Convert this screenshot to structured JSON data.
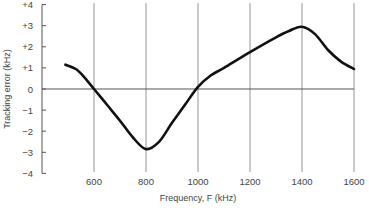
{
  "chart_data": {
    "type": "line",
    "title": "",
    "xlabel": "Frequency, F (kHz)",
    "ylabel": "Tracking error (kHz)",
    "xlim": [
      430,
      1600
    ],
    "ylim": [
      -4,
      4
    ],
    "x_ticks": [
      600,
      800,
      1000,
      1200,
      1400,
      1600
    ],
    "x_tick_labels": [
      "600",
      "800",
      "1000",
      "1200",
      "1400",
      "1600"
    ],
    "y_ticks": [
      4,
      3,
      2,
      1,
      0,
      -1,
      -2,
      -3,
      -4
    ],
    "y_tick_labels": [
      "+4",
      "+3",
      "+2",
      "+1",
      "0",
      "−1",
      "−2",
      "−3",
      "−4"
    ],
    "grid": {
      "vertical": true,
      "horizontal": false,
      "zero_line": true
    },
    "legend": null,
    "series": [
      {
        "name": "Tracking error",
        "color": "#111111",
        "x": [
          490,
          530,
          560,
          600,
          650,
          700,
          750,
          800,
          850,
          900,
          950,
          1000,
          1050,
          1100,
          1200,
          1300,
          1350,
          1400,
          1450,
          1500,
          1550,
          1600
        ],
        "values": [
          1.15,
          0.95,
          0.6,
          0.0,
          -0.75,
          -1.5,
          -2.3,
          -2.85,
          -2.5,
          -1.6,
          -0.75,
          0.1,
          0.65,
          1.0,
          1.75,
          2.45,
          2.75,
          2.95,
          2.6,
          1.85,
          1.3,
          0.95
        ]
      }
    ]
  }
}
